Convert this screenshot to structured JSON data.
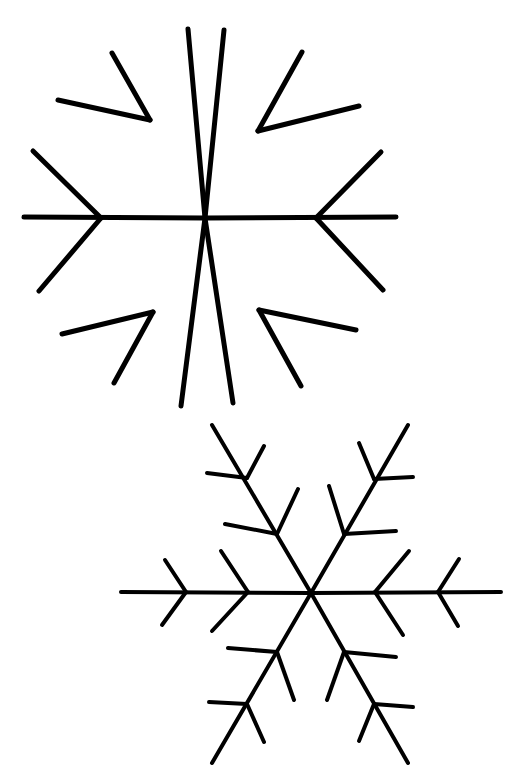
{
  "canvas": {
    "width": 528,
    "height": 780,
    "background_color": "#ffffff",
    "ink_color": "#000000",
    "title": "Two line-drawn snowflakes"
  },
  "figures": [
    {
      "name": "snowflake-top",
      "label": "Upper snowflake — six arms, one branch level",
      "center": {
        "x": 205,
        "y": 218
      },
      "arm_length": 190,
      "stroke_width": 5,
      "branch_levels": 1,
      "arm_count": 6,
      "arm_angles_deg": [
        0,
        60,
        120,
        180,
        240,
        300
      ],
      "segments": [
        {
          "id": "arm-e-main",
          "x1": 205,
          "y1": 218,
          "x2": 396,
          "y2": 217
        },
        {
          "id": "arm-e-up",
          "x1": 316,
          "y1": 218,
          "x2": 381,
          "y2": 152
        },
        {
          "id": "arm-e-down",
          "x1": 316,
          "y1": 218,
          "x2": 383,
          "y2": 290
        },
        {
          "id": "arm-w-main",
          "x1": 205,
          "y1": 218,
          "x2": 24,
          "y2": 217
        },
        {
          "id": "arm-w-up",
          "x1": 101,
          "y1": 218,
          "x2": 33,
          "y2": 151
        },
        {
          "id": "arm-w-down",
          "x1": 101,
          "y1": 218,
          "x2": 39,
          "y2": 291
        },
        {
          "id": "arm-ne-main",
          "x1": 205,
          "y1": 218,
          "x2": 224,
          "y2": 30
        },
        {
          "id": "arm-ne-r1",
          "x1": 258,
          "y1": 131,
          "x2": 302,
          "y2": 52
        },
        {
          "id": "arm-ne-r2",
          "x1": 258,
          "y1": 131,
          "x2": 359,
          "y2": 106
        },
        {
          "id": "arm-nw-main",
          "x1": 205,
          "y1": 218,
          "x2": 188,
          "y2": 29
        },
        {
          "id": "arm-nw-l1",
          "x1": 150,
          "y1": 120,
          "x2": 112,
          "y2": 53
        },
        {
          "id": "arm-nw-l2",
          "x1": 150,
          "y1": 120,
          "x2": 58,
          "y2": 100
        },
        {
          "id": "arm-sw-main",
          "x1": 205,
          "y1": 218,
          "x2": 181,
          "y2": 406
        },
        {
          "id": "arm-sw-l1",
          "x1": 153,
          "y1": 312,
          "x2": 62,
          "y2": 334
        },
        {
          "id": "arm-sw-l2",
          "x1": 153,
          "y1": 312,
          "x2": 114,
          "y2": 383
        },
        {
          "id": "arm-se-main",
          "x1": 205,
          "y1": 218,
          "x2": 233,
          "y2": 403
        },
        {
          "id": "arm-se-r1",
          "x1": 259,
          "y1": 310,
          "x2": 356,
          "y2": 330
        },
        {
          "id": "arm-se-r2",
          "x1": 259,
          "y1": 310,
          "x2": 301,
          "y2": 386
        }
      ]
    },
    {
      "name": "snowflake-bottom",
      "label": "Lower snowflake — six arms, two branch levels each",
      "center": {
        "x": 311,
        "y": 593
      },
      "arm_length": 192,
      "stroke_width": 4,
      "branch_levels": 2,
      "arm_count": 6,
      "arm_angles_deg": [
        0,
        60,
        120,
        180,
        240,
        300
      ],
      "segments": [
        {
          "id": "b-arm-e-main",
          "x1": 311,
          "y1": 593,
          "x2": 501,
          "y2": 592
        },
        {
          "id": "b-arm-e-b1-up",
          "x1": 375,
          "y1": 592,
          "x2": 409,
          "y2": 551
        },
        {
          "id": "b-arm-e-b1-dn",
          "x1": 375,
          "y1": 592,
          "x2": 403,
          "y2": 635
        },
        {
          "id": "b-arm-e-b2-up",
          "x1": 438,
          "y1": 592,
          "x2": 459,
          "y2": 559
        },
        {
          "id": "b-arm-e-b2-dn",
          "x1": 438,
          "y1": 592,
          "x2": 458,
          "y2": 626
        },
        {
          "id": "b-arm-w-main",
          "x1": 311,
          "y1": 593,
          "x2": 121,
          "y2": 592
        },
        {
          "id": "b-arm-w-b1-up",
          "x1": 248,
          "y1": 592,
          "x2": 221,
          "y2": 551
        },
        {
          "id": "b-arm-w-b1-dn",
          "x1": 248,
          "y1": 592,
          "x2": 212,
          "y2": 631
        },
        {
          "id": "b-arm-w-b2-up",
          "x1": 186,
          "y1": 592,
          "x2": 165,
          "y2": 560
        },
        {
          "id": "b-arm-w-b2-dn",
          "x1": 186,
          "y1": 592,
          "x2": 162,
          "y2": 625
        },
        {
          "id": "b-arm-ne-main",
          "x1": 311,
          "y1": 593,
          "x2": 408,
          "y2": 425
        },
        {
          "id": "b-arm-ne-b1-a",
          "x1": 344,
          "y1": 534,
          "x2": 396,
          "y2": 531
        },
        {
          "id": "b-arm-ne-b1-b",
          "x1": 344,
          "y1": 534,
          "x2": 329,
          "y2": 486
        },
        {
          "id": "b-arm-ne-b2-a",
          "x1": 374,
          "y1": 479,
          "x2": 413,
          "y2": 477
        },
        {
          "id": "b-arm-ne-b2-b",
          "x1": 374,
          "y1": 479,
          "x2": 359,
          "y2": 443
        },
        {
          "id": "b-arm-nw-main",
          "x1": 311,
          "y1": 593,
          "x2": 212,
          "y2": 425
        },
        {
          "id": "b-arm-nw-b1-a",
          "x1": 277,
          "y1": 534,
          "x2": 225,
          "y2": 524
        },
        {
          "id": "b-arm-nw-b1-b",
          "x1": 277,
          "y1": 534,
          "x2": 298,
          "y2": 489
        },
        {
          "id": "b-arm-nw-b2-a",
          "x1": 247,
          "y1": 478,
          "x2": 207,
          "y2": 473
        },
        {
          "id": "b-arm-nw-b2-b",
          "x1": 247,
          "y1": 478,
          "x2": 264,
          "y2": 446
        },
        {
          "id": "b-arm-sw-main",
          "x1": 311,
          "y1": 593,
          "x2": 212,
          "y2": 763
        },
        {
          "id": "b-arm-sw-b1-a",
          "x1": 277,
          "y1": 652,
          "x2": 228,
          "y2": 648
        },
        {
          "id": "b-arm-sw-b1-b",
          "x1": 277,
          "y1": 652,
          "x2": 294,
          "y2": 700
        },
        {
          "id": "b-arm-sw-b2-a",
          "x1": 247,
          "y1": 704,
          "x2": 209,
          "y2": 702
        },
        {
          "id": "b-arm-sw-b2-b",
          "x1": 247,
          "y1": 704,
          "x2": 264,
          "y2": 742
        },
        {
          "id": "b-arm-se-main",
          "x1": 311,
          "y1": 593,
          "x2": 408,
          "y2": 763
        },
        {
          "id": "b-arm-se-b1-a",
          "x1": 344,
          "y1": 652,
          "x2": 396,
          "y2": 657
        },
        {
          "id": "b-arm-se-b1-b",
          "x1": 344,
          "y1": 652,
          "x2": 327,
          "y2": 700
        },
        {
          "id": "b-arm-se-b2-a",
          "x1": 374,
          "y1": 704,
          "x2": 413,
          "y2": 707
        },
        {
          "id": "b-arm-se-b2-b",
          "x1": 374,
          "y1": 704,
          "x2": 359,
          "y2": 741
        }
      ]
    }
  ]
}
